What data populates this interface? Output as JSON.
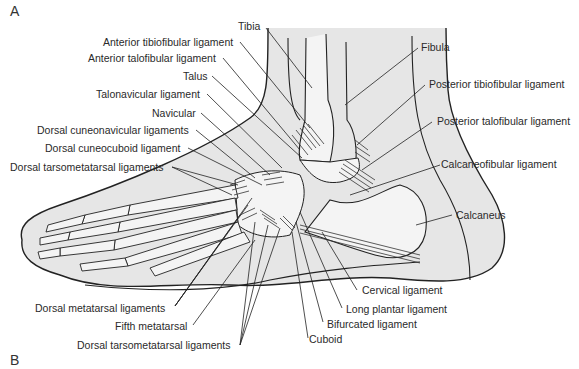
{
  "figure": {
    "panel_a": "A",
    "panel_b": "B",
    "colors": {
      "skin_fill": "#e6e6e6",
      "bone_fill": "#f4f4f4",
      "line": "#222222",
      "text": "#2a2a2a"
    },
    "labels_left": [
      {
        "text": "Tibia"
      },
      {
        "text": "Anterior tibiofibular ligament"
      },
      {
        "text": "Anterior talofibular ligament"
      },
      {
        "text": "Talus"
      },
      {
        "text": "Talonavicular ligament"
      },
      {
        "text": "Navicular"
      },
      {
        "text": "Dorsal cuneonavicular ligaments"
      },
      {
        "text": "Dorsal cuneocuboid ligament"
      },
      {
        "text": "Dorsal tarsometatarsal ligaments"
      }
    ],
    "labels_right": [
      {
        "text": "Fibula"
      },
      {
        "text": "Posterior tibiofibular ligament"
      },
      {
        "text": "Posterior talofibular ligament"
      },
      {
        "text": "Calcaneofibular ligament"
      },
      {
        "text": "Calcaneus"
      }
    ],
    "labels_bottom": [
      {
        "text": "Dorsal metatarsal ligaments"
      },
      {
        "text": "Fifth metatarsal"
      },
      {
        "text": "Dorsal tarsometatarsal ligaments"
      },
      {
        "text": "Cervical ligament"
      },
      {
        "text": "Long plantar ligament"
      },
      {
        "text": "Bifurcated ligament"
      },
      {
        "text": "Cuboid"
      }
    ]
  }
}
